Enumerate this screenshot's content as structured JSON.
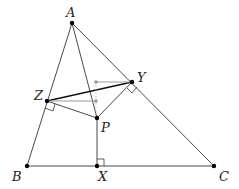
{
  "diagram": {
    "type": "geometry",
    "colors": {
      "line": "#333333",
      "thick_line": "#111111",
      "gray": "#999999",
      "point": "#000000"
    },
    "points": {
      "A": {
        "label": "A",
        "x": 72,
        "y": 23,
        "lx": 66,
        "ly": 15
      },
      "B": {
        "label": "B",
        "x": 27,
        "y": 166,
        "lx": 13,
        "ly": 180
      },
      "C": {
        "label": "C",
        "x": 214,
        "y": 166,
        "lx": 220,
        "ly": 180
      },
      "X": {
        "label": "X",
        "x": 97,
        "y": 166,
        "lx": 99,
        "ly": 180
      },
      "Y": {
        "label": "Y",
        "x": 132,
        "y": 82,
        "lx": 137,
        "ly": 80
      },
      "Z": {
        "label": "Z",
        "x": 47,
        "y": 101,
        "lx": 34,
        "ly": 99
      },
      "P": {
        "label": "P",
        "x": 97,
        "y": 118,
        "lx": 102,
        "ly": 132
      }
    },
    "gray_points": [
      {
        "x": 96,
        "y": 82
      },
      {
        "x": 96,
        "y": 101
      }
    ]
  }
}
